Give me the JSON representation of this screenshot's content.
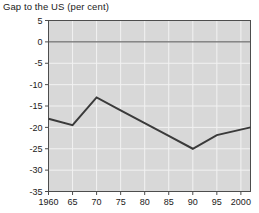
{
  "figure": {
    "title": "Gap to the US (per cent)",
    "background_color": "#ffffff",
    "plot_background_color": "#d8d8d8",
    "gridline_color": "#f2f2f2",
    "axis_color": "#4d4d4d",
    "series_color": "#3a3a3a",
    "zero_line_color": "#4d4d4d"
  },
  "chart_data": {
    "type": "line",
    "title": "Gap to the US (per cent)",
    "xlabel": "",
    "ylabel": "",
    "ylim": [
      -35,
      5
    ],
    "xlim": [
      1960,
      2002
    ],
    "grid": true,
    "legend": null,
    "yticks": [
      5,
      0,
      -5,
      -10,
      -15,
      -20,
      -25,
      -30,
      -35
    ],
    "ytick_labels": [
      "5",
      "0",
      "-5",
      "-10",
      "-15",
      "-20",
      "-25",
      "-30",
      "-35"
    ],
    "xticks": [
      1960,
      1965,
      1970,
      1975,
      1980,
      1985,
      1990,
      1995,
      2000
    ],
    "xtick_labels": [
      "1960",
      "65",
      "70",
      "75",
      "80",
      "85",
      "90",
      "95",
      "2000"
    ],
    "zero_reference_line": 0,
    "series": [
      {
        "name": "Gap to the US",
        "x": [
          1960,
          1965,
          1970,
          1975,
          1980,
          1985,
          1990,
          1995,
          2002
        ],
        "values": [
          -18.0,
          -19.5,
          -13.0,
          -16.0,
          -19.0,
          -22.0,
          -25.0,
          -21.8,
          -20.0
        ]
      }
    ]
  }
}
